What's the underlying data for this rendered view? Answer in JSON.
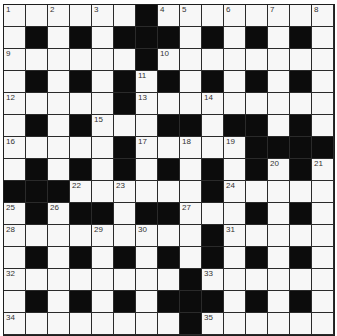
{
  "crossword": {
    "rows": 15,
    "cols": 15,
    "layout": [
      "......#........",
      ".#.#.###.#.#.#.",
      "......#........",
      ".#.#.#.#.#.#.#.",
      ".....#.........",
      ".#.#...##.##.#.",
      ".....#.....####",
      ".#.#.#.#.#.#.#.",
      "###......#.....",
      ".#.##.##...#.#.",
      ".........#.....",
      ".#.#.#.#.#.#.#.",
      "........#......",
      ".#.#.#.###.#.#.",
      "........#......"
    ],
    "numbers": [
      {
        "r": 0,
        "c": 0,
        "n": "1"
      },
      {
        "r": 0,
        "c": 2,
        "n": "2"
      },
      {
        "r": 0,
        "c": 4,
        "n": "3"
      },
      {
        "r": 0,
        "c": 7,
        "n": "4"
      },
      {
        "r": 0,
        "c": 8,
        "n": "5"
      },
      {
        "r": 0,
        "c": 10,
        "n": "6"
      },
      {
        "r": 0,
        "c": 12,
        "n": "7"
      },
      {
        "r": 0,
        "c": 14,
        "n": "8"
      },
      {
        "r": 2,
        "c": 0,
        "n": "9"
      },
      {
        "r": 2,
        "c": 7,
        "n": "10"
      },
      {
        "r": 3,
        "c": 6,
        "n": "11"
      },
      {
        "r": 4,
        "c": 0,
        "n": "12"
      },
      {
        "r": 4,
        "c": 6,
        "n": "13"
      },
      {
        "r": 4,
        "c": 9,
        "n": "14"
      },
      {
        "r": 5,
        "c": 4,
        "n": "15"
      },
      {
        "r": 6,
        "c": 0,
        "n": "16"
      },
      {
        "r": 6,
        "c": 6,
        "n": "17"
      },
      {
        "r": 6,
        "c": 8,
        "n": "18"
      },
      {
        "r": 6,
        "c": 10,
        "n": "19"
      },
      {
        "r": 7,
        "c": 12,
        "n": "20"
      },
      {
        "r": 7,
        "c": 14,
        "n": "21"
      },
      {
        "r": 8,
        "c": 3,
        "n": "22"
      },
      {
        "r": 8,
        "c": 5,
        "n": "23"
      },
      {
        "r": 8,
        "c": 10,
        "n": "24"
      },
      {
        "r": 9,
        "c": 0,
        "n": "25"
      },
      {
        "r": 9,
        "c": 2,
        "n": "26"
      },
      {
        "r": 9,
        "c": 8,
        "n": "27"
      },
      {
        "r": 10,
        "c": 0,
        "n": "28"
      },
      {
        "r": 10,
        "c": 4,
        "n": "29"
      },
      {
        "r": 10,
        "c": 6,
        "n": "30"
      },
      {
        "r": 10,
        "c": 10,
        "n": "31"
      },
      {
        "r": 12,
        "c": 0,
        "n": "32"
      },
      {
        "r": 12,
        "c": 9,
        "n": "33"
      },
      {
        "r": 14,
        "c": 0,
        "n": "34"
      },
      {
        "r": 14,
        "c": 9,
        "n": "35"
      }
    ]
  }
}
